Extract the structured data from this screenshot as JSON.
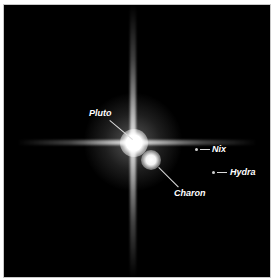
{
  "caption": "",
  "image": {
    "background": "#000000",
    "border_color": "#c8c8c8",
    "bodies": [
      {
        "name": "Pluto",
        "label": "Pluto"
      },
      {
        "name": "Charon",
        "label": "Charon"
      },
      {
        "name": "Nix",
        "label": "Nix"
      },
      {
        "name": "Hydra",
        "label": "Hydra"
      }
    ]
  }
}
